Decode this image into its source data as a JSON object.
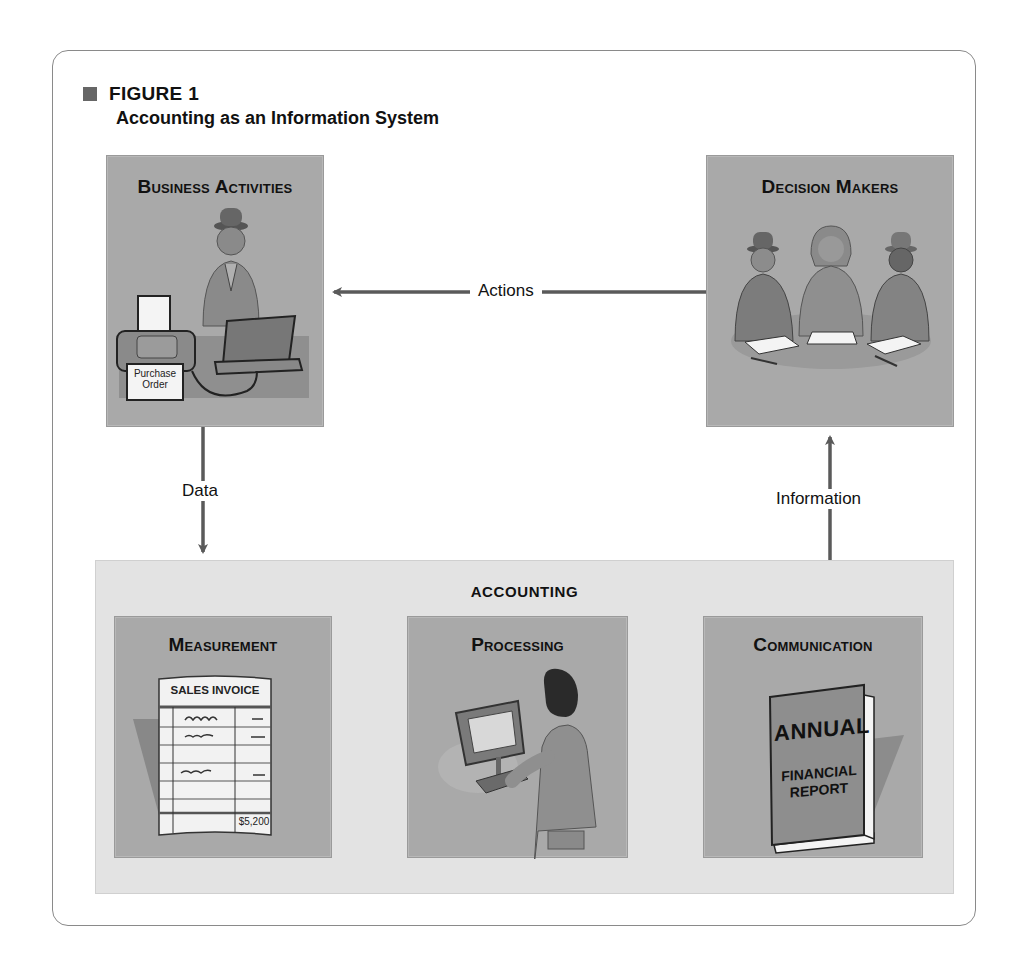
{
  "figure": {
    "number": "FIGURE 1",
    "title": "Accounting as an Information System"
  },
  "boxes": {
    "business_activities": {
      "title": "Business Activities",
      "illustration": "person-at-laptop-with-printer",
      "printer_paper_label_line1": "Purchase",
      "printer_paper_label_line2": "Order"
    },
    "decision_makers": {
      "title": "Decision Makers",
      "illustration": "three-people-at-meeting-table"
    }
  },
  "accounting": {
    "label": "ACCOUNTING",
    "stages": [
      {
        "title": "Measurement",
        "illustration": "sales-invoice",
        "doc_title": "SALES INVOICE",
        "amount": "$5,200"
      },
      {
        "title": "Processing",
        "illustration": "person-at-computer"
      },
      {
        "title": "Communication",
        "illustration": "annual-report-book",
        "book_line1": "ANNUAL",
        "book_line2": "FINANCIAL",
        "book_line3": "REPORT"
      }
    ]
  },
  "arrows": {
    "actions": "Actions",
    "data": "Data",
    "information": "Information"
  },
  "colors": {
    "box_fill": "#a9a9a9",
    "accounting_fill": "#e3e3e3",
    "arrow": "#5a5a5a",
    "panel_border": "#8a8a8a"
  }
}
